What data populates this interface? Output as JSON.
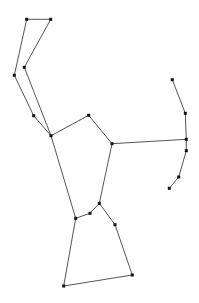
{
  "diagram": {
    "type": "constellation",
    "background": "#ffffff",
    "line_color": "#555555",
    "star_color": "#111111",
    "stars": [
      {
        "id": "s1",
        "x": 26.7,
        "y": 19.3
      },
      {
        "id": "s2",
        "x": 50.7,
        "y": 19.3
      },
      {
        "id": "s3",
        "x": 24.3,
        "y": 67.3
      },
      {
        "id": "s4",
        "x": 14.3,
        "y": 75.3
      },
      {
        "id": "s5",
        "x": 33.7,
        "y": 115.7
      },
      {
        "id": "s6",
        "x": 51.0,
        "y": 135.7
      },
      {
        "id": "s7",
        "x": 88.7,
        "y": 115.3
      },
      {
        "id": "s8",
        "x": 112.0,
        "y": 143.7
      },
      {
        "id": "s9",
        "x": 99.3,
        "y": 203.3
      },
      {
        "id": "s10",
        "x": 90.0,
        "y": 213.3
      },
      {
        "id": "s11",
        "x": 75.7,
        "y": 218.3
      },
      {
        "id": "s12",
        "x": 115.0,
        "y": 224.7
      },
      {
        "id": "s13",
        "x": 132.3,
        "y": 275.0
      },
      {
        "id": "s14",
        "x": 63.7,
        "y": 286.0
      },
      {
        "id": "s15",
        "x": 172.3,
        "y": 79.7
      },
      {
        "id": "s16",
        "x": 185.3,
        "y": 113.3
      },
      {
        "id": "s17",
        "x": 186.3,
        "y": 139.3
      },
      {
        "id": "s18",
        "x": 186.3,
        "y": 150.7
      },
      {
        "id": "s19",
        "x": 178.7,
        "y": 177.0
      },
      {
        "id": "s20",
        "x": 169.3,
        "y": 188.3
      }
    ],
    "edges": [
      [
        "s1",
        "s2"
      ],
      [
        "s1",
        "s4"
      ],
      [
        "s2",
        "s3"
      ],
      [
        "s3",
        "s6"
      ],
      [
        "s4",
        "s5"
      ],
      [
        "s5",
        "s6"
      ],
      [
        "s6",
        "s7"
      ],
      [
        "s7",
        "s8"
      ],
      [
        "s8",
        "s17"
      ],
      [
        "s6",
        "s11"
      ],
      [
        "s8",
        "s9"
      ],
      [
        "s11",
        "s10"
      ],
      [
        "s10",
        "s9"
      ],
      [
        "s9",
        "s12"
      ],
      [
        "s12",
        "s13"
      ],
      [
        "s13",
        "s14"
      ],
      [
        "s14",
        "s11"
      ],
      [
        "s15",
        "s16"
      ],
      [
        "s16",
        "s17"
      ],
      [
        "s17",
        "s18"
      ],
      [
        "s18",
        "s19"
      ],
      [
        "s19",
        "s20"
      ]
    ]
  }
}
